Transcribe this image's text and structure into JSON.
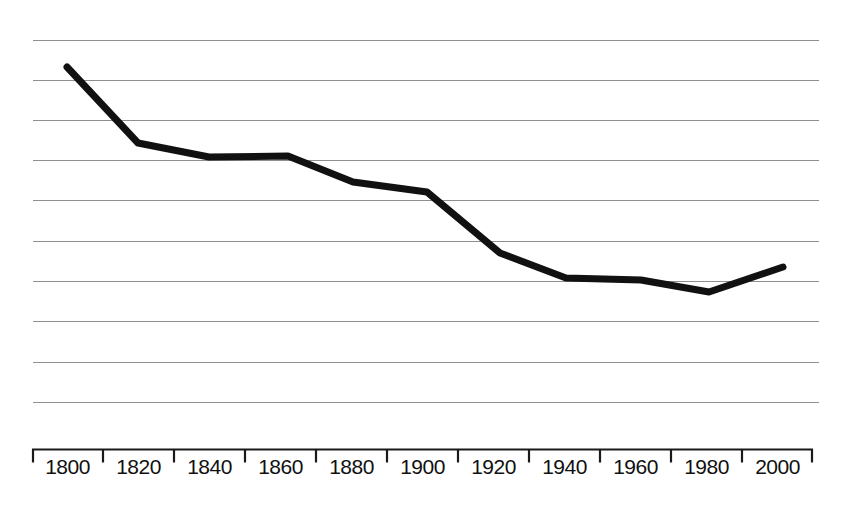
{
  "chart_data": {
    "type": "line",
    "title": "",
    "xlabel": "",
    "ylabel": "",
    "x": [
      1800,
      1820,
      1840,
      1860,
      1880,
      1900,
      1920,
      1940,
      1960,
      1980,
      2000
    ],
    "values": [
      9.3,
      7.4,
      7.1,
      7.1,
      6.4,
      6.1,
      4.6,
      4.0,
      3.95,
      3.6,
      4.2
    ],
    "xlim": [
      1790,
      2010
    ],
    "ylim": [
      0,
      11
    ],
    "x_tick_labels": [
      "1800",
      "1820",
      "1840",
      "1860",
      "1880",
      "1900",
      "1920",
      "1940",
      "1960",
      "1980",
      "2000"
    ],
    "y_tick_labels": [],
    "grid": true,
    "grid_lines": 10,
    "legend": "none",
    "series": [
      {
        "name": "trend",
        "color": "#111111",
        "line_width": 7,
        "values": [
          9.3,
          7.4,
          7.1,
          7.1,
          6.4,
          6.1,
          4.6,
          4.0,
          3.95,
          3.6,
          4.2
        ]
      }
    ],
    "pixel_geometry": {
      "grid_left": 33,
      "grid_right": 819,
      "grid_y": [
        40,
        80,
        120,
        160,
        200,
        241,
        281,
        321,
        362,
        402
      ],
      "axis_y": 449,
      "tick_x": [
        32,
        103,
        174,
        245,
        316,
        387,
        458,
        529,
        600,
        671,
        742,
        813
      ],
      "tick_height": 13,
      "points": [
        [
          67,
          67
        ],
        [
          138,
          143
        ],
        [
          209,
          157
        ],
        [
          288,
          156
        ],
        [
          353,
          182
        ],
        [
          427,
          192
        ],
        [
          500,
          253
        ],
        [
          566,
          278
        ],
        [
          641,
          280
        ],
        [
          709,
          292
        ],
        [
          783,
          267
        ]
      ]
    }
  },
  "axis": {
    "x_labels": [
      "1800",
      "1820",
      "1840",
      "1860",
      "1880",
      "1900",
      "1920",
      "1940",
      "1960",
      "1980",
      "2000"
    ]
  },
  "colors": {
    "series": "#111111",
    "grid": "#8f8f8f",
    "axis": "#1a1a1a",
    "background": "#ffffff"
  }
}
